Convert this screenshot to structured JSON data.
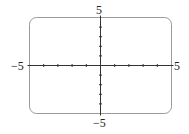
{
  "chart_data": {
    "type": "line",
    "title": "",
    "xlabel": "",
    "ylabel": "",
    "xlim": [
      -5,
      5
    ],
    "ylim": [
      -5,
      5
    ],
    "xscale": 1,
    "yscale": 1,
    "grid": false,
    "series": [],
    "tick_labels": {
      "x_min": "−5",
      "x_max": "5",
      "y_min": "−5",
      "y_max": "5"
    },
    "frame": "rounded viewing window",
    "axis_color": "#333333",
    "frame_color": "#888888"
  }
}
